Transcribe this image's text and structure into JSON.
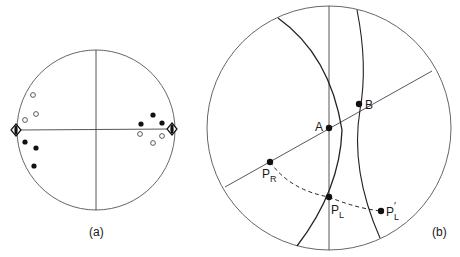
{
  "diagram_a": {
    "caption": "(a)",
    "circle": {
      "cx": 96,
      "cy": 130,
      "rx": 80,
      "ry": 80
    },
    "open_points_left": [
      [
        33,
        95
      ],
      [
        36,
        115
      ],
      [
        25,
        120
      ]
    ],
    "filled_points_left": [
      [
        25,
        142
      ],
      [
        35,
        148
      ],
      [
        34,
        166
      ]
    ],
    "filled_points_right": [
      [
        153,
        115
      ],
      [
        141,
        124
      ],
      [
        162,
        123
      ]
    ],
    "open_points_right": [
      [
        140,
        134
      ],
      [
        153,
        143
      ],
      [
        162,
        136
      ]
    ],
    "diamond_markers": [
      [
        16,
        130
      ],
      [
        172,
        129
      ]
    ]
  },
  "diagram_b": {
    "caption": "(b)",
    "circle": {
      "cx": 329,
      "cy": 128,
      "r": 122
    },
    "labels": {
      "A": "A",
      "B": "B",
      "PR": "P",
      "PR_sub": "R",
      "PL": "P",
      "PL_sub": "L",
      "PLp": "P",
      "PLp_sub": "L",
      "PLp_prime": "′"
    },
    "points": {
      "A": [
        329,
        128
      ],
      "B": [
        359,
        104
      ],
      "PR": [
        270,
        162
      ],
      "PL": [
        329,
        197
      ],
      "PLp": [
        381,
        211
      ]
    }
  },
  "colors": {
    "stroke": "#333333",
    "fill": "#111111",
    "background": "#ffffff"
  }
}
